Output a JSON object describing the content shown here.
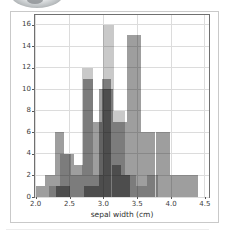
{
  "chart_data": {
    "type": "bar",
    "subtype": "overlapping-histograms",
    "title": "",
    "xlabel": "sepal width (cm)",
    "ylabel": "",
    "xlim": [
      1.99,
      4.56
    ],
    "ylim": [
      0,
      16.9
    ],
    "x_ticks": [
      2.0,
      2.5,
      3.0,
      3.5,
      4.0,
      4.5
    ],
    "x_tick_labels": [
      "2.0",
      "2.5",
      "3.0",
      "3.5",
      "4.0",
      "4.5"
    ],
    "y_ticks": [
      0,
      2,
      4,
      6,
      8,
      10,
      12,
      14,
      16
    ],
    "y_tick_labels": [
      "0",
      "2",
      "4",
      "6",
      "8",
      "10",
      "12",
      "14",
      "16"
    ],
    "grid": true,
    "legend": false,
    "series": [
      {
        "name": "series-1",
        "color": "rgba(0,0,0,0.38)",
        "bin_start": 2.3,
        "bin_width": 0.21,
        "bin_edges": [
          2.3,
          2.51,
          2.72,
          2.93,
          3.14,
          3.35,
          3.56,
          3.77,
          3.98,
          4.19,
          4.4
        ],
        "counts": [
          1,
          0,
          1,
          10,
          7,
          15,
          6,
          6,
          2,
          2
        ]
      },
      {
        "name": "series-2",
        "color": "rgba(0,0,0,0.38)",
        "bin_start": 2.0,
        "bin_width": 0.14,
        "bin_edges": [
          2.0,
          2.14,
          2.28,
          2.42,
          2.56,
          2.7,
          2.84,
          2.98,
          3.12,
          3.26,
          3.4
        ],
        "counts": [
          1,
          2,
          6,
          4,
          3,
          11,
          7,
          11,
          3,
          2
        ]
      },
      {
        "name": "series-3",
        "color": "rgba(0,0,0,0.21)",
        "bin_start": 2.2,
        "bin_width": 0.16,
        "bin_edges": [
          2.2,
          2.36,
          2.52,
          2.68,
          2.84,
          3.0,
          3.16,
          3.32,
          3.48,
          3.64,
          3.8
        ],
        "counts": [
          1,
          4,
          2,
          12,
          2,
          16,
          8,
          2,
          1,
          2
        ]
      }
    ],
    "theme": {
      "background": "#ffffff",
      "frame_border": "#c9c9c9",
      "spine": "#707070",
      "grid": "#dcdcdc",
      "tick": "#555555",
      "tick_label": "#3d3d3d",
      "axis_label": "#2e2e2e"
    }
  }
}
